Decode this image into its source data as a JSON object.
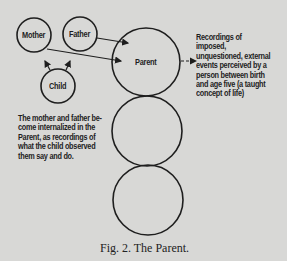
{
  "figure": {
    "caption": "Fig. 2. The Parent.",
    "nodes": {
      "mother": "Mother",
      "father": "Father",
      "child": "Child",
      "parent": "Parent"
    },
    "annotations": {
      "right": "Recordings of imposed,\nunquestioned, external\nevents perceived by a\nperson between birth\nand age five (a taught\nconcept of life)",
      "left": "The mother and father be-\ncome internalized in the\nParent, as recordings of\nwhat the child observed\nthem say and do."
    },
    "colors": {
      "background": "#d8d8d6",
      "ink": "#1e1e1e"
    }
  }
}
